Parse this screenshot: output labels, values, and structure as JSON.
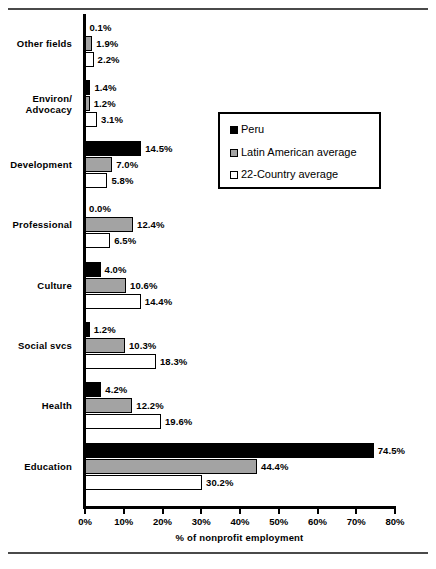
{
  "chart_data": {
    "type": "bar",
    "orientation": "horizontal",
    "title": "",
    "xlabel": "% of nonprofit employment",
    "ylabel": "",
    "xlim": [
      0,
      80
    ],
    "xticks": [
      "0%",
      "10%",
      "20%",
      "30%",
      "40%",
      "50%",
      "60%",
      "70%",
      "80%"
    ],
    "xtick_values": [
      0,
      10,
      20,
      30,
      40,
      50,
      60,
      70,
      80
    ],
    "grid": false,
    "legend_position": "upper right",
    "categories": [
      "Other fields",
      "Environ/\nAdvocacy",
      "Development",
      "Professional",
      "Culture",
      "Social svcs",
      "Health",
      "Education"
    ],
    "series": [
      {
        "name": "Peru",
        "color": "#000000",
        "values": [
          0.1,
          1.4,
          14.5,
          0.0,
          4.0,
          1.2,
          4.2,
          74.5
        ],
        "labels": [
          "0.1%",
          "1.4%",
          "14.5%",
          "0.0%",
          "4.0%",
          "1.2%",
          "4.2%",
          "74.5%"
        ]
      },
      {
        "name": "Latin American average",
        "color": "#a3a3a3",
        "values": [
          1.9,
          1.2,
          7.0,
          12.4,
          10.6,
          10.3,
          12.2,
          44.4
        ],
        "labels": [
          "1.9%",
          "1.2%",
          "7.0%",
          "12.4%",
          "10.6%",
          "10.3%",
          "12.2%",
          "44.4%"
        ]
      },
      {
        "name": "22-Country average",
        "color": "#ffffff",
        "values": [
          2.2,
          3.1,
          5.8,
          6.5,
          14.4,
          18.3,
          19.6,
          30.2
        ],
        "labels": [
          "2.2%",
          "3.1%",
          "5.8%",
          "6.5%",
          "14.4%",
          "18.3%",
          "19.6%",
          "30.2%"
        ]
      }
    ]
  },
  "legend": {
    "items": [
      {
        "label": "Peru",
        "swatch": "peru"
      },
      {
        "label": "Latin American average",
        "swatch": "latin"
      },
      {
        "label": "22-Country average",
        "swatch": "cty22"
      }
    ]
  },
  "caption": ""
}
